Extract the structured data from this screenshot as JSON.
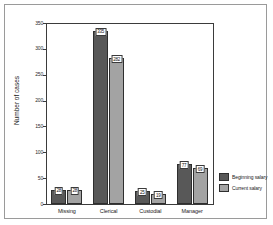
{
  "chart_data": {
    "type": "bar",
    "title": "",
    "xlabel": "",
    "ylabel": "Number of cases",
    "ylim": [
      0,
      350
    ],
    "yticks": [
      0,
      50,
      100,
      150,
      200,
      250,
      300,
      350
    ],
    "ytick_labels": [
      "0",
      "50",
      "100",
      "150",
      "200",
      "250",
      "300",
      "350"
    ],
    "grid": false,
    "legend_position": "right",
    "categories": [
      "Missing",
      "Clerical",
      "Custodial",
      "Manager"
    ],
    "series": [
      {
        "name": "Beginning salary",
        "color": "#585858",
        "values": [
          28,
          335,
          25,
          77
        ],
        "labels": [
          "28",
          "335",
          "25",
          "77"
        ]
      },
      {
        "name": "Current salary",
        "color": "#a3a3a3",
        "values": [
          28,
          282,
          19,
          69
        ],
        "labels": [
          "28",
          "282",
          "19",
          "69"
        ]
      }
    ]
  },
  "axis": {
    "y_title": "Number of cases"
  },
  "legend": {
    "items": [
      {
        "label": "Beginning salary"
      },
      {
        "label": "Current salary"
      }
    ]
  }
}
